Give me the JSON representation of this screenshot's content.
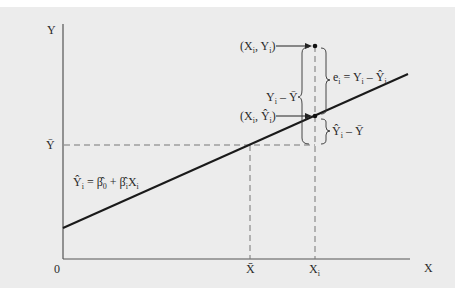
{
  "diagram": {
    "axes": {
      "y_label": "Y",
      "x_label": "X",
      "origin_label": "0",
      "y_mean_label": "Ȳ",
      "x_mean_label": "X̄",
      "x_i_label": "X",
      "x_i_sub": "i"
    },
    "line_equation": {
      "lhs": "Ŷ",
      "lhs_sub": "i",
      "eq": " = ",
      "b0": "β̂",
      "b0_sub": "0",
      "plus": " + ",
      "b1": "β̂",
      "b1_sub": "i",
      "x": "X",
      "x_sub": "i"
    },
    "points": {
      "observed": {
        "open": "(X",
        "sub1": "i",
        "mid": ", Y",
        "sub2": "i",
        "close": ")"
      },
      "fitted": {
        "open": "(X",
        "sub1": "i",
        "mid": ", Ŷ",
        "sub2": "i",
        "close": ")"
      }
    },
    "braces": {
      "residual": {
        "pre": "e",
        "pre_sub": "i",
        "eq": " = Y",
        "y_sub": "i",
        "minus": " – Ŷ",
        "yhat_sub": "i"
      },
      "total": {
        "pre": "Y",
        "pre_sub": "i",
        "rest": " – Ȳ"
      },
      "explained": {
        "pre": "Ŷ",
        "pre_sub": "i",
        "rest": " – Ȳ"
      }
    },
    "colors": {
      "background": "#ececec",
      "line": "#1a1a1a",
      "axis": "#555555",
      "dashed": "#777777"
    }
  }
}
